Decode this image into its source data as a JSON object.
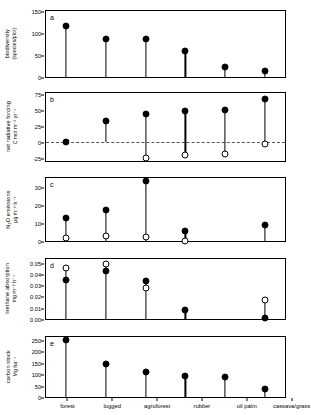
{
  "figure": {
    "categories": [
      "forest",
      "logged",
      "agroforest",
      "rubber",
      "oil palm",
      "cassava/grass"
    ]
  },
  "chart_data": [
    {
      "type": "scatter",
      "panel": "a",
      "title": "",
      "ylabel": "biodiversity (species/plot)",
      "ylabel_line1": "biodiversity",
      "ylabel_line2": "(species/plot)",
      "xlabel": "",
      "categories": [
        "forest",
        "logged",
        "agroforest",
        "rubber",
        "oil palm",
        "cassava/grass"
      ],
      "yticks": [
        0,
        50,
        100,
        150
      ],
      "yticklabels": [
        "0",
        "50",
        "100",
        "150"
      ],
      "ylim": [
        0,
        155
      ],
      "grid": false,
      "series": [
        {
          "name": "mean",
          "marker": "filled-circle",
          "values": [
            120,
            89,
            89,
            60,
            23,
            13
          ]
        }
      ]
    },
    {
      "type": "scatter",
      "panel": "b",
      "title": "",
      "ylabel": "net radiative forcing C mol m-2 yr-1",
      "ylabel_line1": "net radiative forcing",
      "ylabel_line2": "C mol m⁻² yr⁻¹",
      "xlabel": "",
      "categories": [
        "forest",
        "logged",
        "agroforest",
        "rubber",
        "oil palm",
        "cassava/grass"
      ],
      "yticks": [
        -25,
        0,
        25,
        50,
        75
      ],
      "yticklabels": [
        "-25",
        "0",
        "25",
        "50",
        "75"
      ],
      "ylim": [
        -30,
        80
      ],
      "grid": false,
      "zero_reference_line": 0,
      "series": [
        {
          "name": "upper",
          "marker": "filled-circle",
          "values": [
            0,
            34,
            46,
            51,
            52,
            71
          ]
        },
        {
          "name": "lower",
          "marker": "open-circle",
          "values": [
            null,
            null,
            -25,
            -20,
            -18,
            -2
          ]
        }
      ]
    },
    {
      "type": "scatter",
      "panel": "c",
      "title": "",
      "ylabel": "N2O emissions ug m-2 h-1",
      "ylabel_line1": "N₂O emissions",
      "ylabel_line2": "µg m⁻² h⁻¹",
      "xlabel": "",
      "categories": [
        "forest",
        "logged",
        "agroforest",
        "rubber",
        "oil palm",
        "cassava/grass"
      ],
      "yticks": [
        0,
        10,
        20,
        30
      ],
      "yticklabels": [
        "0",
        "10",
        "20",
        "30"
      ],
      "ylim": [
        0,
        36
      ],
      "grid": false,
      "series": [
        {
          "name": "upper",
          "marker": "filled-circle",
          "values": [
            13,
            17.5,
            34.5,
            5.5,
            null,
            9
          ]
        },
        {
          "name": "lower",
          "marker": "open-circle",
          "values": [
            1.5,
            3,
            2.5,
            0.2,
            null,
            null
          ]
        }
      ]
    },
    {
      "type": "scatter",
      "panel": "d",
      "title": "",
      "ylabel": "methane absorption mg m-2 h-1",
      "ylabel_line1": "methane absorption",
      "ylabel_line2": "mg m⁻² h⁻¹",
      "xlabel": "",
      "categories": [
        "forest",
        "logged",
        "agroforest",
        "rubber",
        "oil palm",
        "cassava/grass"
      ],
      "yticks": [
        0.0,
        0.01,
        0.02,
        0.03,
        0.04,
        0.05
      ],
      "yticklabels": [
        "0.00",
        "0.01",
        "0.02",
        "0.03",
        "0.04",
        "0.05"
      ],
      "ylim": [
        0,
        0.055
      ],
      "grid": false,
      "series": [
        {
          "name": "filled",
          "marker": "filled-circle",
          "values": [
            0.036,
            0.044,
            0.0345,
            0.0085,
            null,
            0.0005
          ]
        },
        {
          "name": "open",
          "marker": "open-circle",
          "values": [
            0.0465,
            0.0505,
            0.0285,
            null,
            null,
            0.0175
          ]
        }
      ]
    },
    {
      "type": "scatter",
      "panel": "e",
      "title": "",
      "ylabel": "carbon stock Mg ha-1",
      "ylabel_line1": "carbon stock",
      "ylabel_line2": "Mg ha⁻¹",
      "xlabel": "",
      "categories": [
        "forest",
        "logged",
        "agroforest",
        "rubber",
        "oil palm",
        "cassava/grass"
      ],
      "yticks": [
        0,
        50,
        100,
        150,
        200,
        250
      ],
      "yticklabels": [
        "0",
        "50",
        "100",
        "150",
        "200",
        "250"
      ],
      "ylim": [
        0,
        270
      ],
      "grid": false,
      "series": [
        {
          "name": "mean",
          "marker": "filled-circle",
          "values": [
            255,
            148,
            113,
            93,
            89,
            35
          ]
        }
      ]
    }
  ]
}
